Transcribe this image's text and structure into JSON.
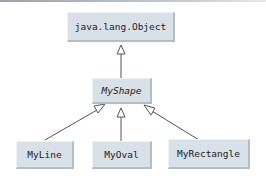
{
  "diagram": {
    "type": "UML class inheritance hierarchy",
    "nodes": {
      "object": {
        "label": "java.lang.Object",
        "abstract": false
      },
      "shape": {
        "label": "MyShape",
        "abstract": true
      },
      "line": {
        "label": "MyLine",
        "abstract": false
      },
      "oval": {
        "label": "MyOval",
        "abstract": false
      },
      "rectangle": {
        "label": "MyRectangle",
        "abstract": false
      }
    },
    "edges": [
      {
        "from": "MyShape",
        "to": "java.lang.Object",
        "kind": "generalization"
      },
      {
        "from": "MyLine",
        "to": "MyShape",
        "kind": "generalization"
      },
      {
        "from": "MyOval",
        "to": "MyShape",
        "kind": "generalization"
      },
      {
        "from": "MyRectangle",
        "to": "MyShape",
        "kind": "generalization"
      }
    ],
    "colors": {
      "box_fill": "#d9e1e8",
      "box_shadow": "#b4bcc4",
      "line": "#555555"
    }
  }
}
